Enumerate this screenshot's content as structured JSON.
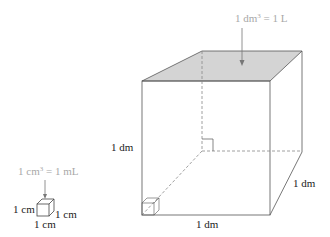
{
  "diagram": {
    "type": "volume-units-illustration",
    "large_cube": {
      "annotation": "1 dm³ = 1 L",
      "annotation_parts": {
        "pre": "1 dm",
        "sup": "3",
        "post": " = 1 L"
      },
      "height_label": "1 dm",
      "width_label": "1 dm",
      "depth_label": "1 dm",
      "top_face_color": "#d4d4d4"
    },
    "small_cube": {
      "annotation": "1 cm³ = 1 mL",
      "annotation_parts": {
        "pre": "1 cm",
        "sup": "3",
        "post": " = 1 mL"
      },
      "height_label": "1 cm",
      "width_label": "1 cm",
      "depth_label": "1 cm"
    },
    "colors": {
      "line": "#555555",
      "annotation_text": "#a8a8a8",
      "label_text": "#222222",
      "hidden_edge": "#888888"
    }
  }
}
